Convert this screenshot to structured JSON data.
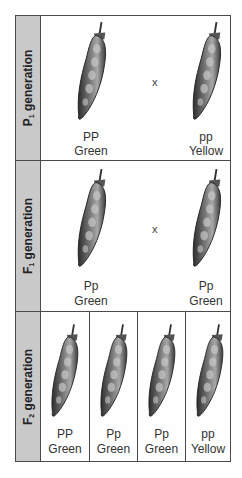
{
  "rows": [
    {
      "id": "p1",
      "label_main": "P",
      "label_sub": "1",
      "label_rest": " generation",
      "cross_symbol": "x",
      "pods": [
        {
          "genotype": "PP",
          "phenotype": "Green"
        },
        {
          "genotype": "pp",
          "phenotype": "Yellow"
        }
      ]
    },
    {
      "id": "f1",
      "label_main": "F",
      "label_sub": "1",
      "label_rest": " generation",
      "cross_symbol": "x",
      "pods": [
        {
          "genotype": "Pp",
          "phenotype": "Green"
        },
        {
          "genotype": "Pp",
          "phenotype": "Green"
        }
      ]
    },
    {
      "id": "f2",
      "label_main": "F",
      "label_sub": "2",
      "label_rest": " generation",
      "pods": [
        {
          "genotype": "PP",
          "phenotype": "Green"
        },
        {
          "genotype": "Pp",
          "phenotype": "Green"
        },
        {
          "genotype": "Pp",
          "phenotype": "Green"
        },
        {
          "genotype": "pp",
          "phenotype": "Yellow"
        }
      ]
    }
  ],
  "colors": {
    "side_panel": "#c9c9c9",
    "border": "#4a4a4a",
    "pod_dark": "#3a3a3a",
    "pod_light": "#bdbdbd"
  }
}
